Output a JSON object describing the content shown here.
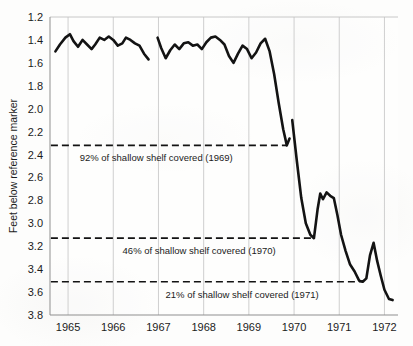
{
  "chart_data": {
    "type": "line",
    "title": "",
    "xlabel": "",
    "ylabel": "Feet below reference marker",
    "y_axis_inverted": true,
    "ylim": [
      1.2,
      3.8
    ],
    "xlim": [
      1964.6,
      1972.3
    ],
    "y_ticks": [
      "1.2",
      "1.4",
      "1.6",
      "1.8",
      "2.0",
      "2.2",
      "2.4",
      "2.6",
      "2.8",
      "3.0",
      "3.2",
      "3.4",
      "3.6",
      "3.8"
    ],
    "y_tick_values": [
      1.2,
      1.4,
      1.6,
      1.8,
      2.0,
      2.2,
      2.4,
      2.6,
      2.8,
      3.0,
      3.2,
      3.4,
      3.6,
      3.8
    ],
    "x_ticks": [
      "1965",
      "1966",
      "1967",
      "1968",
      "1969",
      "1970",
      "1971",
      "1972"
    ],
    "x_tick_values": [
      1965,
      1966,
      1967,
      1968,
      1969,
      1970,
      1971,
      1972
    ],
    "grid": "vertical",
    "legend": "none",
    "line_color": "#131313",
    "grid_color": "#c9c9c9",
    "series": [
      {
        "name": "Water level",
        "segments": [
          {
            "name": "segment-1",
            "x": [
              1964.72,
              1964.82,
              1964.94,
              1965.04,
              1965.12,
              1965.22,
              1965.32,
              1965.42,
              1965.52,
              1965.6,
              1965.7,
              1965.8,
              1965.9,
              1966.0,
              1966.1,
              1966.2,
              1966.28,
              1966.38,
              1966.48,
              1966.58,
              1966.68,
              1966.78
            ],
            "y": [
              1.5,
              1.44,
              1.38,
              1.35,
              1.41,
              1.46,
              1.4,
              1.44,
              1.48,
              1.44,
              1.38,
              1.4,
              1.37,
              1.4,
              1.45,
              1.43,
              1.38,
              1.4,
              1.43,
              1.45,
              1.52,
              1.57
            ]
          },
          {
            "name": "segment-2",
            "x": [
              1966.98,
              1967.06,
              1967.16,
              1967.26,
              1967.36,
              1967.46,
              1967.56,
              1967.66,
              1967.76,
              1967.86,
              1967.96,
              1968.06,
              1968.16,
              1968.26,
              1968.36,
              1968.46,
              1968.56,
              1968.66,
              1968.76,
              1968.86,
              1968.96,
              1969.06,
              1969.16,
              1969.26,
              1969.36,
              1969.46,
              1969.56,
              1969.66,
              1969.76,
              1969.84,
              1969.9
            ],
            "y": [
              1.38,
              1.47,
              1.56,
              1.49,
              1.44,
              1.48,
              1.43,
              1.42,
              1.45,
              1.44,
              1.48,
              1.42,
              1.38,
              1.37,
              1.4,
              1.44,
              1.54,
              1.6,
              1.52,
              1.45,
              1.48,
              1.56,
              1.51,
              1.43,
              1.39,
              1.5,
              1.7,
              1.95,
              2.18,
              2.32,
              2.26
            ]
          },
          {
            "name": "segment-3",
            "x": [
              1969.96,
              1970.06,
              1970.16,
              1970.26,
              1970.36,
              1970.44,
              1970.52,
              1970.58,
              1970.64,
              1970.72,
              1970.8,
              1970.88,
              1970.96,
              1971.04,
              1971.14,
              1971.24,
              1971.34,
              1971.44,
              1971.52,
              1971.6,
              1971.68,
              1971.76,
              1971.84,
              1971.92,
              1972.0,
              1972.1,
              1972.18
            ],
            "y": [
              2.1,
              2.45,
              2.78,
              3.0,
              3.1,
              3.13,
              2.88,
              2.74,
              2.79,
              2.73,
              2.76,
              2.78,
              2.93,
              3.1,
              3.24,
              3.36,
              3.42,
              3.5,
              3.51,
              3.48,
              3.28,
              3.17,
              3.33,
              3.46,
              3.58,
              3.66,
              3.67
            ]
          }
        ]
      }
    ],
    "reference_lines": [
      {
        "name": "reference-line-1969",
        "value": 2.32,
        "label": "92% of shallow shelf covered (1969)",
        "label_x": 1966.95,
        "label_y": 2.46,
        "x_start": 1964.62,
        "x_end": 1969.85
      },
      {
        "name": "reference-line-1970",
        "value": 3.13,
        "label": "46% of shallow shelf covered (1970)",
        "label_x": 1967.9,
        "label_y": 3.27,
        "x_start": 1964.62,
        "x_end": 1970.44
      },
      {
        "name": "reference-line-1971",
        "value": 3.51,
        "label": "21% of shallow shelf covered (1971)",
        "label_x": 1968.85,
        "label_y": 3.65,
        "x_start": 1964.62,
        "x_end": 1971.52
      }
    ],
    "annotations": [
      "92% of shallow shelf covered (1969)",
      "46% of shallow shelf covered (1970)",
      "21% of shallow shelf covered (1971)"
    ]
  }
}
